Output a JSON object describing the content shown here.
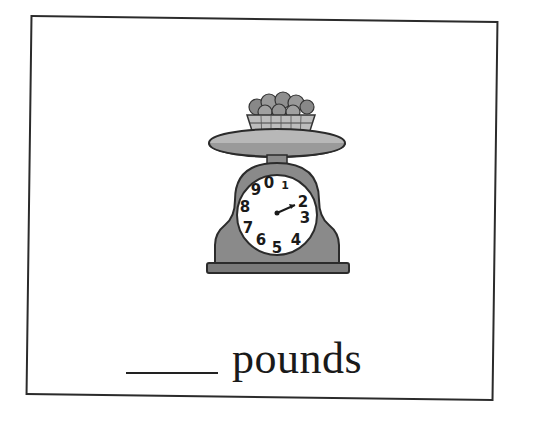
{
  "worksheet": {
    "question": {
      "blank": "",
      "unit_label": "pounds"
    },
    "illustration": {
      "subject": "scale-with-basket-of-fruit",
      "dial_numbers": [
        "0",
        "1",
        "2",
        "3",
        "4",
        "5",
        "6",
        "7",
        "8",
        "9"
      ],
      "pointer_at": "2",
      "colors": {
        "scale_body": "#8a8a8a",
        "tray": "#b5b5b5",
        "dial": "#ffffff",
        "outline": "#2b2b2b"
      }
    }
  }
}
